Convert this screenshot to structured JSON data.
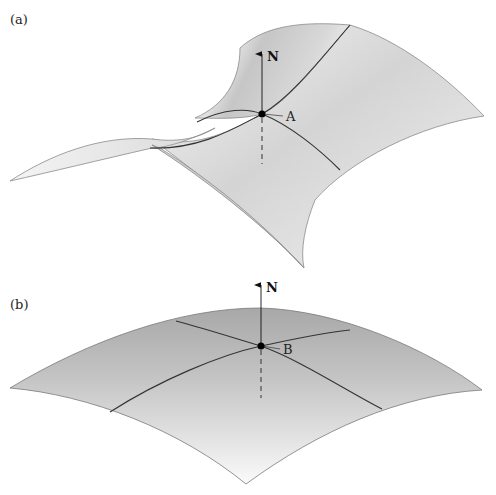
{
  "figure": {
    "panels": [
      {
        "id": "a",
        "label": "(a)",
        "surface": "saddle",
        "point_label": "A",
        "normal_label": "N"
      },
      {
        "id": "b",
        "label": "(b)",
        "surface": "dome",
        "point_label": "B",
        "normal_label": "N"
      }
    ],
    "colors": {
      "surface_light": "#f4f4f4",
      "surface_mid": "#d2d2d2",
      "surface_dark": "#a9a9a9",
      "edge": "#8a8a8a",
      "curve": "#333333",
      "point": "#000000"
    }
  }
}
